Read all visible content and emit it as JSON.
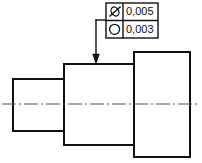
{
  "drawing": {
    "title": "Stepped shaft with geometric tolerance callout",
    "background_color": "#ffffff",
    "line_color": "#111111",
    "centerline_color": "#555555",
    "canvas": {
      "width": 202,
      "height": 163
    },
    "part": {
      "name": "stepped-shaft",
      "description": "Three coaxial cylindrical steps, increasing diameter left to right",
      "steps": [
        {
          "name": "left-small-cylinder",
          "x": 13,
          "y": 79,
          "width": 51,
          "height": 52
        },
        {
          "name": "middle-cylinder",
          "x": 64,
          "y": 64,
          "width": 70,
          "height": 81
        },
        {
          "name": "right-large-cylinder",
          "x": 134,
          "y": 52,
          "width": 56,
          "height": 105
        }
      ]
    },
    "centerline": {
      "name": "axis-centerline",
      "y": 104,
      "x_start": 2,
      "x_end": 200,
      "pattern": "dash-dot"
    },
    "leader": {
      "name": "leader-line",
      "horizontal_y": 20,
      "x_from": 106,
      "x_corner": 96,
      "arrow_y": 64,
      "arrowhead": "solid-filled-triangle",
      "points_to": "middle-cylinder-top-surface"
    }
  },
  "feature_control_frame": {
    "name": "geometric-tolerance-frame",
    "x": 106,
    "y": 3,
    "width": 52,
    "height": 35,
    "symbol_column_width": 17,
    "rows": [
      {
        "symbol_name": "circular-runout-icon",
        "symbol_description": "slanted ellipse with diagonal stroke",
        "characteristic": "runout",
        "tolerance_value": "0,005"
      },
      {
        "symbol_name": "circularity-icon",
        "symbol_description": "circle",
        "characteristic": "circularity",
        "tolerance_value": "0,003"
      }
    ]
  }
}
